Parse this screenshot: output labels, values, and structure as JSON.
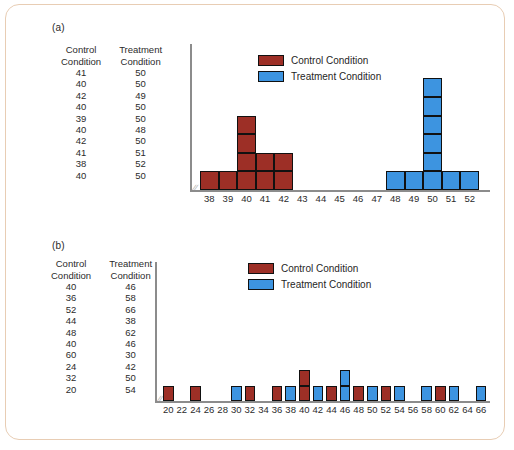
{
  "colors": {
    "control": "#9d2f26",
    "treatment": "#3d94e0",
    "outline": "#111111",
    "axis": "#8c8c8c",
    "frame": "#e8cdb4"
  },
  "panels": [
    {
      "label": "(a)",
      "table": {
        "headers": [
          "Control\nCondition",
          "Treatment\nCondition"
        ],
        "header_control_line1": "Control",
        "header_control_line2": "Condition",
        "header_treatment_line1": "Treatment",
        "header_treatment_line2": "Condition",
        "rows": [
          [
            "41",
            "50"
          ],
          [
            "40",
            "50"
          ],
          [
            "42",
            "49"
          ],
          [
            "40",
            "50"
          ],
          [
            "39",
            "50"
          ],
          [
            "40",
            "48"
          ],
          [
            "42",
            "50"
          ],
          [
            "41",
            "51"
          ],
          [
            "38",
            "52"
          ],
          [
            "40",
            "50"
          ]
        ]
      },
      "legend": [
        {
          "label": "Control Condition",
          "color": "#9d2f26",
          "key": "control"
        },
        {
          "label": "Treatment Condition",
          "color": "#3d94e0",
          "key": "treatment"
        }
      ],
      "chart_data": {
        "type": "bar",
        "title": "",
        "xlabel": "",
        "ylabel": "",
        "axis_break": true,
        "unit": "stacked-square dotplot",
        "categories": [
          38,
          39,
          40,
          41,
          42,
          43,
          44,
          45,
          46,
          47,
          48,
          49,
          50,
          51,
          52
        ],
        "series": [
          {
            "name": "Control Condition",
            "color": "#9d2f26",
            "values": [
              1,
              1,
              4,
              2,
              2,
              0,
              0,
              0,
              0,
              0,
              0,
              0,
              0,
              0,
              0
            ]
          },
          {
            "name": "Treatment Condition",
            "color": "#3d94e0",
            "values": [
              0,
              0,
              0,
              0,
              0,
              0,
              0,
              0,
              0,
              0,
              1,
              1,
              6,
              1,
              1
            ]
          }
        ],
        "ylim": [
          0,
          7
        ],
        "grid": false,
        "legend_position": "top-center"
      }
    },
    {
      "label": "(b)",
      "table": {
        "header_control_line1": "Control",
        "header_control_line2": "Condition",
        "header_treatment_line1": "Treatment",
        "header_treatment_line2": "Condition",
        "rows": [
          [
            "40",
            "46"
          ],
          [
            "36",
            "58"
          ],
          [
            "52",
            "66"
          ],
          [
            "44",
            "38"
          ],
          [
            "48",
            "62"
          ],
          [
            "40",
            "46"
          ],
          [
            "60",
            "30"
          ],
          [
            "24",
            "42"
          ],
          [
            "32",
            "50"
          ],
          [
            "20",
            "54"
          ]
        ]
      },
      "legend": [
        {
          "label": "Control Condition",
          "color": "#9d2f26",
          "key": "control"
        },
        {
          "label": "Treatment Condition",
          "color": "#3d94e0",
          "key": "treatment"
        }
      ],
      "chart_data": {
        "type": "bar",
        "title": "",
        "xlabel": "",
        "ylabel": "",
        "axis_break": true,
        "unit": "stacked-square dotplot",
        "categories": [
          20,
          22,
          24,
          26,
          28,
          30,
          32,
          34,
          36,
          38,
          40,
          42,
          44,
          46,
          48,
          50,
          52,
          54,
          56,
          58,
          60,
          62,
          64,
          66
        ],
        "series": [
          {
            "name": "Control Condition",
            "color": "#9d2f26",
            "values": [
              1,
              0,
              1,
              0,
              0,
              0,
              1,
              0,
              1,
              0,
              2,
              0,
              1,
              0,
              1,
              0,
              1,
              0,
              0,
              0,
              1,
              0,
              0,
              0
            ]
          },
          {
            "name": "Treatment Condition",
            "color": "#3d94e0",
            "values": [
              0,
              0,
              0,
              0,
              0,
              1,
              0,
              0,
              0,
              1,
              0,
              1,
              0,
              2,
              0,
              1,
              0,
              1,
              0,
              1,
              0,
              1,
              0,
              1
            ]
          }
        ],
        "ylim": [
          0,
          3
        ],
        "grid": false,
        "legend_position": "top-center"
      }
    }
  ]
}
